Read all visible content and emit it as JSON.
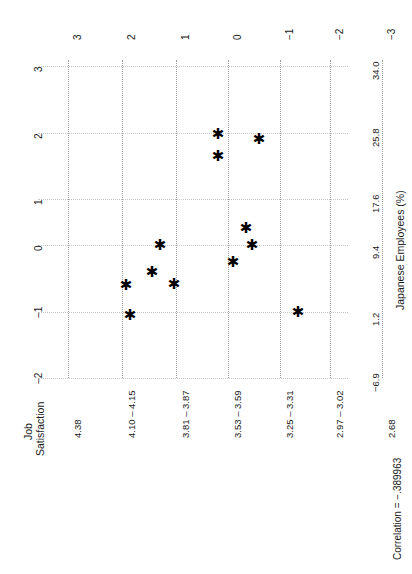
{
  "chart_data": {
    "type": "scatter",
    "title": "",
    "orientation": "rotated-90-ccw",
    "xlabel": "Job Satisfaction",
    "ylabel": "Japanese Employees (%)",
    "x_tick_labels": [
      "4.38",
      "4.10 – 4.15",
      "3.81 – 3.87",
      "3.53 – 3.59",
      "3.25 – 3.31",
      "2.97 – 3.02",
      "2.68"
    ],
    "y_tick_labels": [
      "−6.9",
      "1.2",
      "9.4",
      "17.6",
      "25.8",
      "34.0"
    ],
    "y_tick_values": [
      -6.9,
      1.2,
      9.4,
      17.6,
      25.8,
      34.0
    ],
    "std_axis_top_labels": [
      "3",
      "2",
      "1",
      "0",
      "−1",
      "−2",
      "−3"
    ],
    "std_axis_left_labels": [
      "3",
      "2",
      "1",
      "0",
      "−1",
      "−2"
    ],
    "grid": true,
    "annotation": "Correlation = −.389963",
    "correlation": -0.389963,
    "points": [
      {
        "sx": 218,
        "sy": 134
      },
      {
        "sx": 259,
        "sy": 139
      },
      {
        "sx": 218,
        "sy": 156
      },
      {
        "sx": 246,
        "sy": 228
      },
      {
        "sx": 160,
        "sy": 245
      },
      {
        "sx": 252,
        "sy": 245
      },
      {
        "sx": 233,
        "sy": 262
      },
      {
        "sx": 152,
        "sy": 272
      },
      {
        "sx": 174,
        "sy": 284
      },
      {
        "sx": 126,
        "sy": 285
      },
      {
        "sx": 298,
        "sy": 312
      },
      {
        "sx": 130,
        "sy": 315
      }
    ],
    "marker": "✱"
  },
  "axes": {
    "left_axis_title_line1": "Job",
    "left_axis_title_line2": "Satisfaction",
    "right_axis_title": "Japanese Employees (%)",
    "footer_note": "Correlation = −.389963"
  },
  "left_ticks": [
    {
      "label": "4.38",
      "pos": 68
    },
    {
      "label": "4.10 – 4.15",
      "pos": 122
    },
    {
      "label": "3.81 – 3.87",
      "pos": 176
    },
    {
      "label": "3.53 – 3.59",
      "pos": 228
    },
    {
      "label": "3.25 – 3.31",
      "pos": 280
    },
    {
      "label": "2.97 – 3.02",
      "pos": 330
    },
    {
      "label": "2.68",
      "pos": 382
    }
  ],
  "right_ticks": [
    {
      "label": "34.0",
      "pos": 66
    },
    {
      "label": "25.8",
      "pos": 133
    },
    {
      "label": "17.6",
      "pos": 199
    },
    {
      "label": "9.4",
      "pos": 245
    },
    {
      "label": "1.2",
      "pos": 312
    },
    {
      "label": "−6.9",
      "pos": 378
    }
  ],
  "top_ticks_outer": [
    {
      "label": "3",
      "pos": 68
    },
    {
      "label": "2",
      "pos": 122
    },
    {
      "label": "1",
      "pos": 176
    },
    {
      "label": "0",
      "pos": 228
    },
    {
      "label": "−1",
      "pos": 280
    },
    {
      "label": "−2",
      "pos": 330
    },
    {
      "label": "−3",
      "pos": 382
    }
  ],
  "side_ticks_outer": [
    {
      "label": "3",
      "pos": 66
    },
    {
      "label": "2",
      "pos": 133
    },
    {
      "label": "1",
      "pos": 199
    },
    {
      "label": "0",
      "pos": 245
    },
    {
      "label": "−1",
      "pos": 312
    },
    {
      "label": "−2",
      "pos": 378
    }
  ],
  "vgrid": [
    68,
    122,
    176,
    228,
    280,
    330,
    382
  ],
  "hgrid": [
    66,
    133,
    199,
    245,
    312,
    378
  ]
}
